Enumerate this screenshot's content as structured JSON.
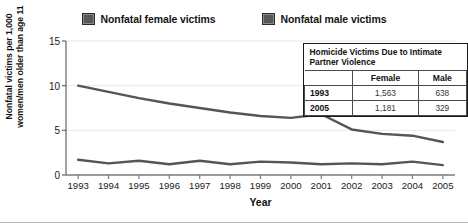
{
  "legend": {
    "entries": [
      {
        "label": "Nonfatal female victims",
        "color": "#585858",
        "icon": "legend-swatch-icon"
      },
      {
        "label": "Nonfatal male victims",
        "color": "#585858",
        "icon": "legend-swatch-icon"
      }
    ]
  },
  "axes": {
    "y_title": "Nonfatal victims per 1,000 women/men older than age 11",
    "x_title": "Year",
    "y_ticks": [
      "0",
      "5",
      "10",
      "15"
    ],
    "x_ticks": [
      "1993",
      "1994",
      "1995",
      "1996",
      "1997",
      "1998",
      "1999",
      "2000",
      "2001",
      "2002",
      "2003",
      "2004",
      "2005"
    ]
  },
  "inset_table": {
    "title": "Homicide Victims Due to Intimate Partner Violence",
    "columns": [
      "",
      "Female",
      "Male"
    ],
    "rows": [
      {
        "year": "1993",
        "female": "1,563",
        "male": "638"
      },
      {
        "year": "2005",
        "female": "1,181",
        "male": "329"
      }
    ]
  },
  "chart_data": {
    "type": "line",
    "title": "",
    "xlabel": "Year",
    "ylabel": "Nonfatal victims per 1,000 women/men older than age 11",
    "x": [
      1993,
      1994,
      1995,
      1996,
      1997,
      1998,
      1999,
      2000,
      2001,
      2002,
      2003,
      2004,
      2005
    ],
    "xlim": [
      1992.6,
      2005.4
    ],
    "ylim": [
      0,
      15
    ],
    "yticks": [
      0,
      5,
      10,
      15
    ],
    "grid": true,
    "legend_position": "top-center",
    "line_color": "#555555",
    "series": [
      {
        "name": "Nonfatal female victims",
        "values": [
          10.0,
          9.3,
          8.6,
          8.0,
          7.5,
          7.0,
          6.6,
          6.4,
          6.8,
          5.1,
          4.6,
          4.4,
          3.7
        ]
      },
      {
        "name": "Nonfatal male victims",
        "values": [
          1.7,
          1.3,
          1.6,
          1.2,
          1.6,
          1.2,
          1.5,
          1.4,
          1.2,
          1.3,
          1.2,
          1.5,
          1.1
        ]
      }
    ]
  }
}
